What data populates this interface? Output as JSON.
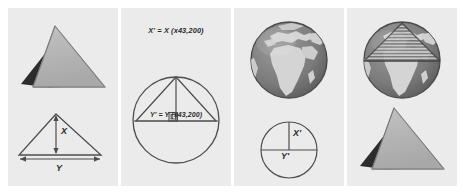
{
  "figure": {
    "background_color": "#ffffff",
    "panel_background_color": "#ebebeb",
    "ink_color": "#4d4d4d",
    "panel_count": 4
  },
  "panels": [
    {
      "id": "panel-1",
      "name": "pyramid-and-measured-triangle",
      "items": {
        "pyramid_caption": "",
        "height_label": "X",
        "base_label": "Y"
      }
    },
    {
      "id": "panel-2",
      "name": "scaling-equations-circle",
      "items": {
        "equation_top": "X' = X (x43,200)",
        "equation_bottom": "Y' = Y (x43,200)",
        "scale_factor": "x43,200",
        "right_angle_marker": "⊾"
      }
    },
    {
      "id": "panel-3",
      "name": "globe-and-scaled-circle",
      "items": {
        "globe_caption": "",
        "scaled_height_label": "X'",
        "scaled_width_label": "Y'"
      }
    },
    {
      "id": "panel-4",
      "name": "globe-with-inscribed-pyramid",
      "items": {
        "globe_caption": "",
        "pyramid_caption": ""
      }
    }
  ],
  "colors": {
    "pyramid_front": "#b3b3b3",
    "pyramid_left": "#9a9a9a",
    "pyramid_shadow": "#2e2e2e",
    "pyramid_outline": "#6e6e6e",
    "globe_ocean": "#7d7d7d",
    "globe_land": "#d2d2d2",
    "line": "#4d4d4d",
    "panel_bg": "#ebebeb",
    "page_bg": "#ffffff"
  }
}
